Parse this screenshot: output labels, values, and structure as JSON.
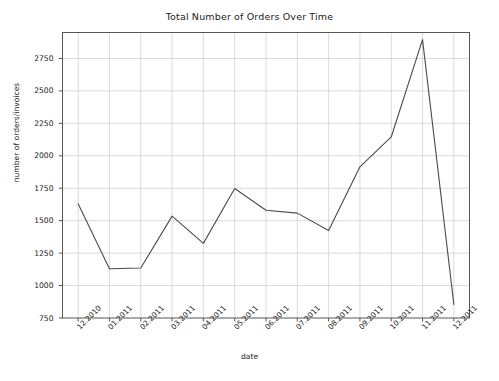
{
  "chart_data": {
    "type": "line",
    "title": "Total Number of Orders Over Time",
    "xlabel": "date",
    "ylabel": "number of orders/invoices",
    "categories": [
      "12.2010",
      "01.2011",
      "02.2011",
      "03.2011",
      "04.2011",
      "05.2011",
      "06.2011",
      "07.2011",
      "08.2011",
      "09.2011",
      "10.2011",
      "11.2011",
      "12.2011"
    ],
    "values": [
      1630,
      1130,
      1135,
      1535,
      1325,
      1748,
      1580,
      1558,
      1425,
      1915,
      2145,
      2895,
      855
    ],
    "series": [
      {
        "name": "number of orders/invoices",
        "values": [
          1630,
          1130,
          1135,
          1535,
          1325,
          1748,
          1580,
          1558,
          1425,
          1915,
          2145,
          2895,
          855
        ]
      }
    ],
    "ylim": [
      750,
      2950
    ],
    "yticks": [
      750,
      1000,
      1250,
      1500,
      1750,
      2000,
      2250,
      2500,
      2750
    ],
    "ytick_labels": [
      "750",
      "1000",
      "1250",
      "1500",
      "1750",
      "2000",
      "2250",
      "2500",
      "2750"
    ],
    "grid": true,
    "legend": "none",
    "line_color": "#4a4a52",
    "grid_color": "#d0d0d0",
    "axes_color": "#555555",
    "background": "#ffffff"
  }
}
